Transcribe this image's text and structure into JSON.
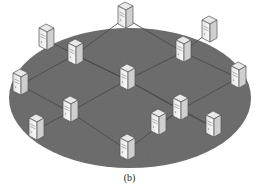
{
  "figure": {
    "caption": "(b)",
    "surface_color": "#6e6e6e",
    "grid_color": "#4a4a4a",
    "server_face": "#f2f2f2",
    "server_side": "#cfcfcf",
    "server_top": "#e6e6e6",
    "server_edge": "#555555"
  },
  "servers": [
    {
      "id": "s1",
      "x": 125,
      "y": 18
    },
    {
      "id": "s2",
      "x": 46,
      "y": 40
    },
    {
      "id": "s3",
      "x": 75,
      "y": 55
    },
    {
      "id": "s4",
      "x": 209,
      "y": 32
    },
    {
      "id": "s5",
      "x": 183,
      "y": 52
    },
    {
      "id": "s6",
      "x": 20,
      "y": 85
    },
    {
      "id": "s7",
      "x": 127,
      "y": 80
    },
    {
      "id": "s8",
      "x": 238,
      "y": 78
    },
    {
      "id": "s9",
      "x": 70,
      "y": 112
    },
    {
      "id": "s10",
      "x": 180,
      "y": 110
    },
    {
      "id": "s11",
      "x": 36,
      "y": 130
    },
    {
      "id": "s12",
      "x": 158,
      "y": 125
    },
    {
      "id": "s13",
      "x": 213,
      "y": 127
    },
    {
      "id": "s14",
      "x": 127,
      "y": 150
    }
  ]
}
